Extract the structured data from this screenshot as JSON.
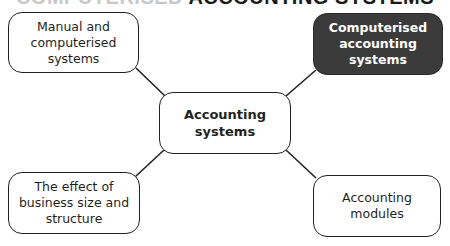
{
  "heading": {
    "faint_prefix": "COMPUTERISED",
    "text": "ACCOUNTING SYSTEMS",
    "clipped": true
  },
  "diagram": {
    "type": "mind-map",
    "center": {
      "label": "Accounting systems"
    },
    "branches": [
      {
        "position": "top-left",
        "label": "Manual and computerised systems",
        "highlighted": false
      },
      {
        "position": "top-right",
        "label": "Computerised accounting systems",
        "highlighted": true
      },
      {
        "position": "bottom-left",
        "label": "The effect of business size and structure",
        "highlighted": false
      },
      {
        "position": "bottom-right",
        "label": "Accounting modules",
        "highlighted": false
      }
    ],
    "colors": {
      "highlight_fill": "#3b3b3b",
      "highlight_text": "#ffffff",
      "border": "#222222",
      "line": "#222222"
    }
  }
}
